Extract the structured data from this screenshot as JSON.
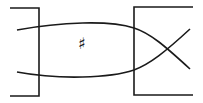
{
  "diagram": {
    "type": "string-diagram",
    "stroke_color": "#1a1a1a",
    "background": "#ffffff",
    "left_box": {
      "label": ""
    },
    "right_box": {
      "label": ""
    },
    "center_label": "♯",
    "strands": [
      {
        "name": "upper-strand",
        "from": "left",
        "to": "right-lower"
      },
      {
        "name": "lower-strand",
        "from": "left",
        "to": "right-upper"
      }
    ],
    "crossing": {
      "x": 166,
      "y": 49
    }
  }
}
